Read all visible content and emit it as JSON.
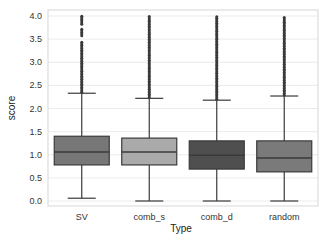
{
  "chart_data": {
    "type": "box",
    "title": "",
    "xlabel": "Type",
    "ylabel": "score",
    "ylim": [
      -0.1,
      4.0
    ],
    "yticks": [
      0.0,
      0.5,
      1.0,
      1.5,
      2.0,
      2.5,
      3.0,
      3.5,
      4.0
    ],
    "ytick_labels": [
      "0.0",
      "0.5",
      "1.0",
      "1.5",
      "2.0",
      "2.5",
      "3.0",
      "3.5",
      "4.0"
    ],
    "grid": true,
    "legend": null,
    "categories": [
      "SV",
      "comb_s",
      "comb_d",
      "random"
    ],
    "series": [
      {
        "name": "SV",
        "whisker_low": 0.06,
        "q1": 0.78,
        "median": 1.06,
        "q3": 1.4,
        "whisker_high": 2.33,
        "outliers_from": 2.35,
        "outliers_to": 4.0,
        "color": "#777777"
      },
      {
        "name": "comb_s",
        "whisker_low": 0.0,
        "q1": 0.78,
        "median": 1.06,
        "q3": 1.36,
        "whisker_high": 2.22,
        "outliers_from": 2.24,
        "outliers_to": 4.0,
        "color": "#aaaaaa"
      },
      {
        "name": "comb_d",
        "whisker_low": 0.0,
        "q1": 0.69,
        "median": 0.99,
        "q3": 1.3,
        "whisker_high": 2.18,
        "outliers_from": 2.2,
        "outliers_to": 4.0,
        "color": "#4f4f4f"
      },
      {
        "name": "random",
        "whisker_low": 0.0,
        "q1": 0.63,
        "median": 0.93,
        "q3": 1.3,
        "whisker_high": 2.27,
        "outliers_from": 2.29,
        "outliers_to": 4.0,
        "color": "#7a7a7a"
      }
    ]
  },
  "colors": {
    "grid": "#e6e6e6",
    "frame": "#cccccc",
    "line": "#3a3a3a",
    "outlier": "#3a3a3a"
  }
}
